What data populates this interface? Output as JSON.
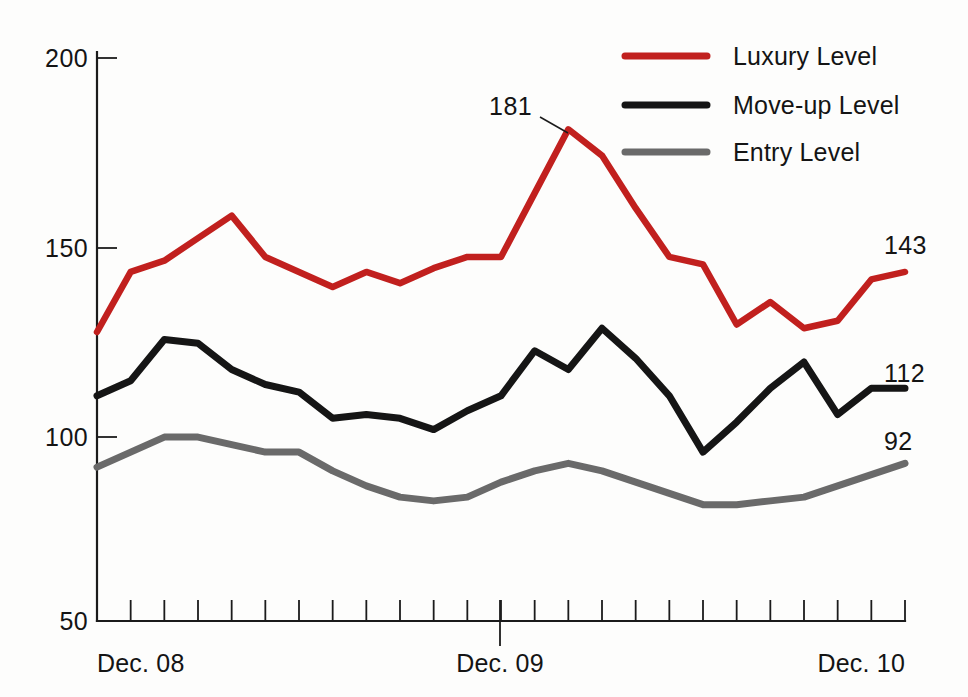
{
  "chart_data": {
    "type": "line",
    "title": "",
    "subtitle": "",
    "xlabel": "",
    "ylabel": "",
    "ylim": [
      50,
      200
    ],
    "yticks": [
      50,
      100,
      150,
      200
    ],
    "ytick_labels": [
      "50",
      "100",
      "150",
      "200"
    ],
    "grid": false,
    "legend_position": "top-right",
    "x": [
      "Dec. 08",
      "Jan. 09",
      "Feb. 09",
      "Mar. 09",
      "Apr. 09",
      "May 09",
      "Jun. 09",
      "Jul. 09",
      "Aug. 09",
      "Sep. 09",
      "Oct. 09",
      "Nov. 09",
      "Dec. 09",
      "Jan. 10",
      "Feb. 10",
      "Mar. 10",
      "Apr. 10",
      "May 10",
      "Jun. 10",
      "Jul. 10",
      "Aug. 10",
      "Sep. 10",
      "Oct. 10",
      "Nov. 10",
      "Dec. 10"
    ],
    "xtick_labels_visible": [
      "Dec. 08",
      "Dec. 09",
      "Dec. 10"
    ],
    "xtick_count": 25,
    "series": [
      {
        "name": "Luxury Level",
        "color": "#c1201e",
        "values": [
          127,
          143,
          146,
          152,
          158,
          147,
          143,
          139,
          143,
          140,
          144,
          147,
          147,
          164,
          181,
          174,
          160,
          147,
          145,
          129,
          135,
          128,
          130,
          141,
          143
        ]
      },
      {
        "name": "Move-up Level",
        "color": "#151515",
        "values": [
          110,
          114,
          125,
          124,
          117,
          113,
          111,
          104,
          105,
          104,
          101,
          106,
          110,
          122,
          117,
          128,
          120,
          110,
          95,
          103,
          112,
          119,
          105,
          112,
          112
        ]
      },
      {
        "name": "Entry Level",
        "color": "#6a6a6a",
        "values": [
          91,
          95,
          99,
          99,
          97,
          95,
          95,
          90,
          86,
          83,
          82,
          83,
          87,
          90,
          92,
          90,
          87,
          84,
          81,
          81,
          82,
          83,
          86,
          89,
          92
        ]
      }
    ],
    "annotations": [
      {
        "text": "181",
        "series": "Luxury Level",
        "x_index": 14,
        "value": 181,
        "placement": "callout-left"
      },
      {
        "text": "143",
        "series": "Luxury Level",
        "x_index": 24,
        "value": 143,
        "placement": "end-right"
      },
      {
        "text": "112",
        "series": "Move-up Level",
        "x_index": 24,
        "value": 112,
        "placement": "end-right"
      },
      {
        "text": "92",
        "series": "Entry Level",
        "x_index": 24,
        "value": 92,
        "placement": "end-right"
      }
    ]
  },
  "legend": {
    "items": [
      {
        "label": "Luxury Level",
        "color": "#c1201e"
      },
      {
        "label": "Move-up Level",
        "color": "#151515"
      },
      {
        "label": "Entry Level",
        "color": "#6a6a6a"
      }
    ]
  },
  "axes": {
    "y_labels": [
      "200",
      "150",
      "100",
      "50"
    ],
    "x_labels": [
      "Dec. 08",
      "Dec. 09",
      "Dec. 10"
    ]
  },
  "value_labels": {
    "peak": "181",
    "luxury_end": "143",
    "moveup_end": "112",
    "entry_end": "92"
  }
}
